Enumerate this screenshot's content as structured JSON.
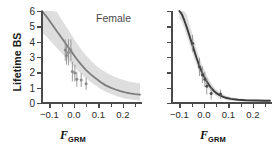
{
  "figure": {
    "background": "#ffffff",
    "axis_color": "#4a4a4a",
    "band_color": "#d8d8d8",
    "curve_color_female": "#7d7d7d",
    "curve_color_male": "#3c3c3c",
    "point_color": "#8a8a8a"
  },
  "ylabel": "Lifetime BS",
  "xlabel": {
    "variable": "F",
    "subscript": "GRM"
  },
  "panels": [
    {
      "tag": "Female"
    },
    {
      "tag": "Male"
    }
  ],
  "chart_data": [
    {
      "type": "scatter",
      "title": "Female",
      "xlabel": "F_GRM",
      "ylabel": "Lifetime BS",
      "xlim": [
        -0.13,
        0.27
      ],
      "ylim": [
        0,
        6
      ],
      "yticks": [
        0,
        1,
        2,
        3,
        4,
        5,
        6
      ],
      "ytick_labels": [
        "0",
        "1",
        "2",
        "3",
        "4",
        "5",
        "6"
      ],
      "xticks": [
        -0.1,
        -0.05,
        0.0,
        0.05,
        0.1,
        0.15,
        0.2,
        0.25
      ],
      "xtick_labels": [
        "-0.1",
        "",
        "0.0",
        "",
        "0.1",
        "",
        "0.2",
        ""
      ],
      "grid": false,
      "legend": "none",
      "series": [
        {
          "name": "fitted curve",
          "type": "line",
          "x": [
            -0.13,
            -0.11,
            -0.09,
            -0.07,
            -0.05,
            -0.03,
            -0.01,
            0.01,
            0.03,
            0.05,
            0.07,
            0.09,
            0.11,
            0.13,
            0.15,
            0.17,
            0.19,
            0.21,
            0.23,
            0.25,
            0.27
          ],
          "y": [
            6.0,
            5.6,
            5.15,
            4.7,
            4.25,
            3.8,
            3.35,
            2.9,
            2.5,
            2.15,
            1.85,
            1.6,
            1.35,
            1.15,
            1.0,
            0.88,
            0.78,
            0.7,
            0.63,
            0.58,
            0.54
          ]
        },
        {
          "name": "95% confidence band upper",
          "type": "line",
          "x": [
            -0.13,
            -0.11,
            -0.09,
            -0.07,
            -0.05,
            -0.03,
            -0.01,
            0.01,
            0.03,
            0.05,
            0.07,
            0.09,
            0.11,
            0.13,
            0.15,
            0.17,
            0.19,
            0.21,
            0.23,
            0.25,
            0.27
          ],
          "y": [
            6.0,
            6.0,
            6.0,
            5.95,
            5.45,
            4.95,
            4.45,
            3.95,
            3.5,
            3.1,
            2.75,
            2.45,
            2.2,
            2.0,
            1.82,
            1.68,
            1.56,
            1.46,
            1.38,
            1.32,
            1.28
          ]
        },
        {
          "name": "95% confidence band lower",
          "type": "line",
          "x": [
            -0.13,
            -0.11,
            -0.09,
            -0.07,
            -0.05,
            -0.03,
            -0.01,
            0.01,
            0.03,
            0.05,
            0.07,
            0.09,
            0.11,
            0.13,
            0.15,
            0.17,
            0.19,
            0.21,
            0.23,
            0.25,
            0.27
          ],
          "y": [
            4.6,
            4.3,
            3.95,
            3.6,
            3.25,
            2.9,
            2.55,
            2.2,
            1.9,
            1.6,
            1.35,
            1.12,
            0.92,
            0.74,
            0.6,
            0.48,
            0.38,
            0.3,
            0.24,
            0.2,
            0.17
          ]
        },
        {
          "name": "binned means",
          "type": "scatter",
          "x": [
            -0.035,
            -0.03,
            -0.022,
            -0.012,
            -0.006,
            0.004,
            0.012,
            0.03,
            0.05
          ],
          "y": [
            3.45,
            3.1,
            3.3,
            3.45,
            2.05,
            1.95,
            1.55,
            1.5,
            1.25
          ],
          "yerr": [
            0.7,
            0.6,
            0.85,
            0.7,
            0.65,
            0.55,
            0.5,
            0.45,
            0.4
          ]
        }
      ]
    },
    {
      "type": "scatter",
      "title": "Male",
      "xlabel": "F_GRM",
      "ylabel": "Lifetime BS",
      "xlim": [
        -0.13,
        0.27
      ],
      "ylim": [
        0,
        6
      ],
      "yticks": [
        0,
        1,
        2,
        3,
        4,
        5,
        6
      ],
      "ytick_labels": [
        "",
        "",
        "",
        "",
        "",
        "",
        ""
      ],
      "xticks": [
        -0.1,
        -0.05,
        0.0,
        0.05,
        0.1,
        0.15,
        0.2,
        0.25
      ],
      "xtick_labels": [
        "-0.1",
        "",
        "0.0",
        "",
        "0.1",
        "",
        "0.2",
        ""
      ],
      "grid": false,
      "legend": "none",
      "series": [
        {
          "name": "fitted curve",
          "type": "line",
          "x": [
            -0.1,
            -0.09,
            -0.08,
            -0.07,
            -0.06,
            -0.05,
            -0.04,
            -0.03,
            -0.02,
            -0.01,
            0.0,
            0.01,
            0.02,
            0.03,
            0.04,
            0.05,
            0.06,
            0.07,
            0.09,
            0.11,
            0.14,
            0.17,
            0.21,
            0.25,
            0.27
          ],
          "y": [
            6.0,
            5.8,
            5.4,
            4.95,
            4.45,
            3.95,
            3.45,
            2.95,
            2.5,
            2.1,
            1.75,
            1.45,
            1.2,
            0.98,
            0.8,
            0.66,
            0.55,
            0.46,
            0.34,
            0.27,
            0.21,
            0.18,
            0.16,
            0.15,
            0.15
          ]
        },
        {
          "name": "95% confidence band upper",
          "type": "line",
          "x": [
            -0.1,
            -0.09,
            -0.08,
            -0.07,
            -0.06,
            -0.05,
            -0.04,
            -0.03,
            -0.02,
            -0.01,
            0.0,
            0.01,
            0.02,
            0.03,
            0.04,
            0.05,
            0.06,
            0.07,
            0.09,
            0.11,
            0.14,
            0.17,
            0.21,
            0.25,
            0.27
          ],
          "y": [
            6.0,
            6.0,
            6.0,
            5.75,
            5.2,
            4.65,
            4.1,
            3.55,
            3.05,
            2.6,
            2.2,
            1.85,
            1.56,
            1.3,
            1.08,
            0.9,
            0.76,
            0.64,
            0.48,
            0.38,
            0.3,
            0.26,
            0.24,
            0.23,
            0.23
          ]
        },
        {
          "name": "95% confidence band lower",
          "type": "line",
          "x": [
            -0.1,
            -0.09,
            -0.08,
            -0.07,
            -0.06,
            -0.05,
            -0.04,
            -0.03,
            -0.02,
            -0.01,
            0.0,
            0.01,
            0.02,
            0.03,
            0.04,
            0.05,
            0.06,
            0.07,
            0.09,
            0.11,
            0.14,
            0.17,
            0.21,
            0.25,
            0.27
          ],
          "y": [
            5.5,
            5.3,
            4.9,
            4.4,
            3.9,
            3.4,
            2.92,
            2.48,
            2.08,
            1.72,
            1.4,
            1.14,
            0.92,
            0.74,
            0.58,
            0.46,
            0.37,
            0.3,
            0.2,
            0.15,
            0.11,
            0.09,
            0.08,
            0.08,
            0.08
          ]
        },
        {
          "name": "binned means",
          "type": "scatter",
          "x": [
            -0.046,
            -0.018,
            -0.006,
            0.004,
            0.012,
            0.03,
            0.068
          ],
          "y": [
            3.9,
            2.35,
            1.85,
            1.55,
            1.1,
            0.62,
            0.58
          ],
          "yerr": [
            0.55,
            0.6,
            0.55,
            0.5,
            0.55,
            0.4,
            0.3
          ]
        }
      ]
    }
  ]
}
